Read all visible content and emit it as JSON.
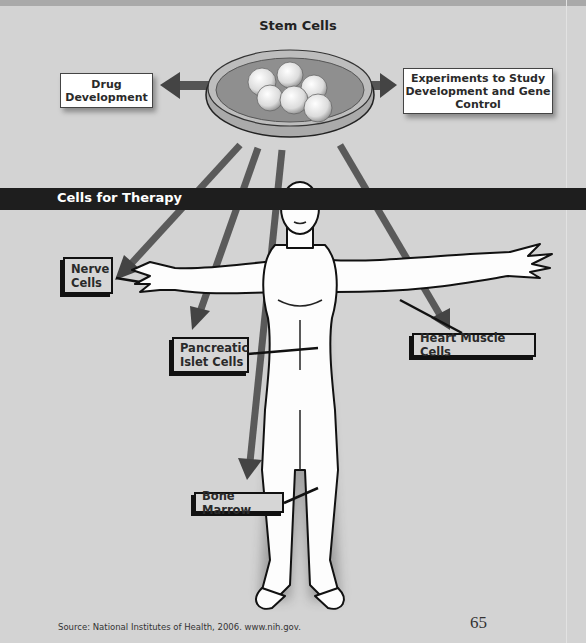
{
  "page": {
    "top_caption_fragment": "...",
    "colors": {
      "background": "#d3d3d3",
      "band": "#1e1e1e",
      "arrow": "#555555",
      "box_fill": "#ffffff",
      "label_fill": "#d6d6d6"
    }
  },
  "diagram": {
    "title": "Stem Cells",
    "top_boxes": [
      {
        "id": "drug",
        "label_lines": [
          "Drug",
          "Development"
        ]
      },
      {
        "id": "experiments",
        "label_lines": [
          "Experiments to Study",
          "Development and Gene",
          "Control"
        ]
      }
    ],
    "band_label": "Cells for Therapy",
    "therapy_labels": [
      {
        "id": "nerve",
        "label_lines": [
          "Nerve",
          "Cells"
        ]
      },
      {
        "id": "pancreatic",
        "label_lines": [
          "Pancreatic",
          "Islet Cells"
        ]
      },
      {
        "id": "heart",
        "label_lines": [
          "Heart Muscle Cells"
        ]
      },
      {
        "id": "bone",
        "label_lines": [
          "Bone Marrow"
        ]
      }
    ]
  },
  "footer": {
    "source": "Source: National Institutes of Health, 2006. www.nih.gov.",
    "page_number": "65"
  }
}
